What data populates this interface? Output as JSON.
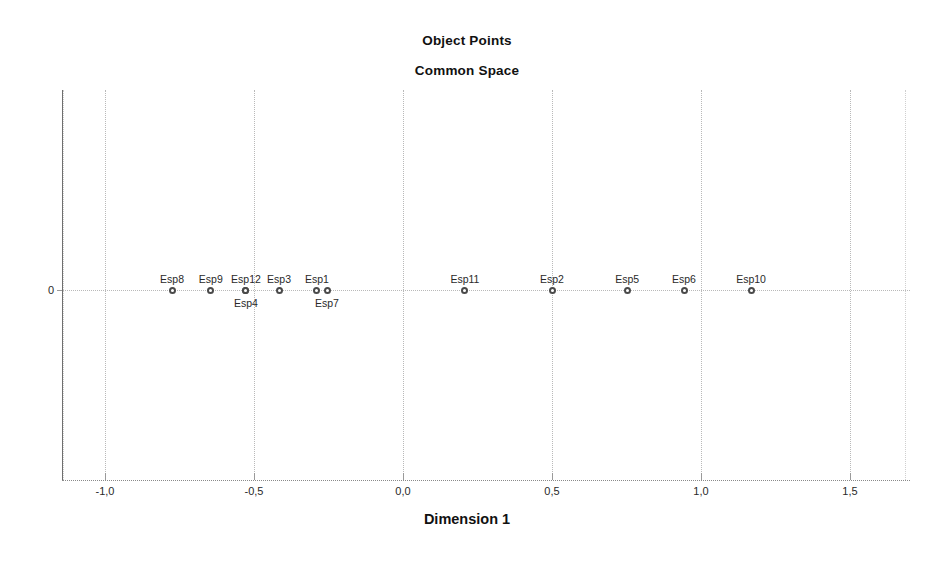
{
  "chart_data": {
    "type": "scatter",
    "title": "Object Points",
    "subtitle": "Common Space",
    "xlabel": "Dimension 1",
    "ylabel": "",
    "grid": true,
    "legend": false,
    "xlim": [
      -1.15,
      1.55
    ],
    "ylim": [
      -1.0,
      1.0
    ],
    "xticks": [
      -1.0,
      -0.5,
      0.0,
      0.5,
      1.0,
      1.5
    ],
    "xtick_labels": [
      "-1,0",
      "-0,5",
      "0,0",
      "0,5",
      "1,0",
      "1,5"
    ],
    "yticks": [
      0
    ],
    "ytick_labels": [
      "0"
    ],
    "decimal_separator": ",",
    "points": [
      {
        "label": "Esp8",
        "x": -0.775,
        "y": 0.0,
        "label_position": "above"
      },
      {
        "label": "Esp9",
        "x": -0.645,
        "y": 0.0,
        "label_position": "above"
      },
      {
        "label": "Esp12",
        "x": -0.527,
        "y": 0.0,
        "label_position": "above"
      },
      {
        "label": "Esp4",
        "x": -0.527,
        "y": 0.0,
        "label_position": "below"
      },
      {
        "label": "Esp3",
        "x": -0.416,
        "y": 0.0,
        "label_position": "above"
      },
      {
        "label": "Esp1",
        "x": -0.289,
        "y": 0.0,
        "label_position": "above"
      },
      {
        "label": "Esp7",
        "x": -0.255,
        "y": 0.0,
        "label_position": "below"
      },
      {
        "label": "Esp11",
        "x": 0.208,
        "y": 0.0,
        "label_position": "above"
      },
      {
        "label": "Esp2",
        "x": 0.5,
        "y": 0.0,
        "label_position": "above"
      },
      {
        "label": "Esp5",
        "x": 0.752,
        "y": 0.0,
        "label_position": "above"
      },
      {
        "label": "Esp6",
        "x": 0.943,
        "y": 0.0,
        "label_position": "above"
      },
      {
        "label": "Esp10",
        "x": 1.168,
        "y": 0.0,
        "label_position": "above"
      }
    ],
    "colors": {
      "marker_edge": "#4a4a4a",
      "marker_fill": "#ffffff",
      "grid": "#b9b9b9",
      "axis": "#6f6f6f",
      "text": "#1a1a1a",
      "background": "#ffffff"
    }
  }
}
